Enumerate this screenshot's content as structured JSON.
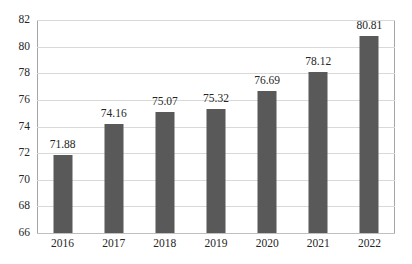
{
  "chart_data": {
    "type": "bar",
    "title": "",
    "subtitle": "",
    "xlabel": "",
    "ylabel": "",
    "categories": [
      "2016",
      "2017",
      "2018",
      "2019",
      "2020",
      "2021",
      "2022"
    ],
    "values": [
      71.88,
      74.16,
      75.07,
      75.32,
      76.69,
      78.12,
      80.81
    ],
    "data_labels": [
      "71.88",
      "74.16",
      "75.07",
      "75.32",
      "76.69",
      "78.12",
      "80.81"
    ],
    "ylim": [
      66,
      82
    ],
    "ytick_step": 2,
    "ytick_labels": [
      "82",
      "80",
      "78",
      "76",
      "74",
      "72",
      "70",
      "68",
      "66"
    ],
    "ytick_values": [
      82,
      80,
      78,
      76,
      74,
      72,
      70,
      68,
      66
    ],
    "grid": true,
    "grid_axis": "y",
    "legend": false,
    "legend_position": "none",
    "series": [
      {
        "name": "",
        "values": [
          71.88,
          74.16,
          75.07,
          75.32,
          76.69,
          78.12,
          80.81
        ]
      }
    ]
  },
  "style": {
    "bar_color": "#595959",
    "gridline_color": "#d9d9d9",
    "axis_line_color": "#a6a6a6",
    "text_color": "#262626",
    "background_color": "#ffffff"
  }
}
